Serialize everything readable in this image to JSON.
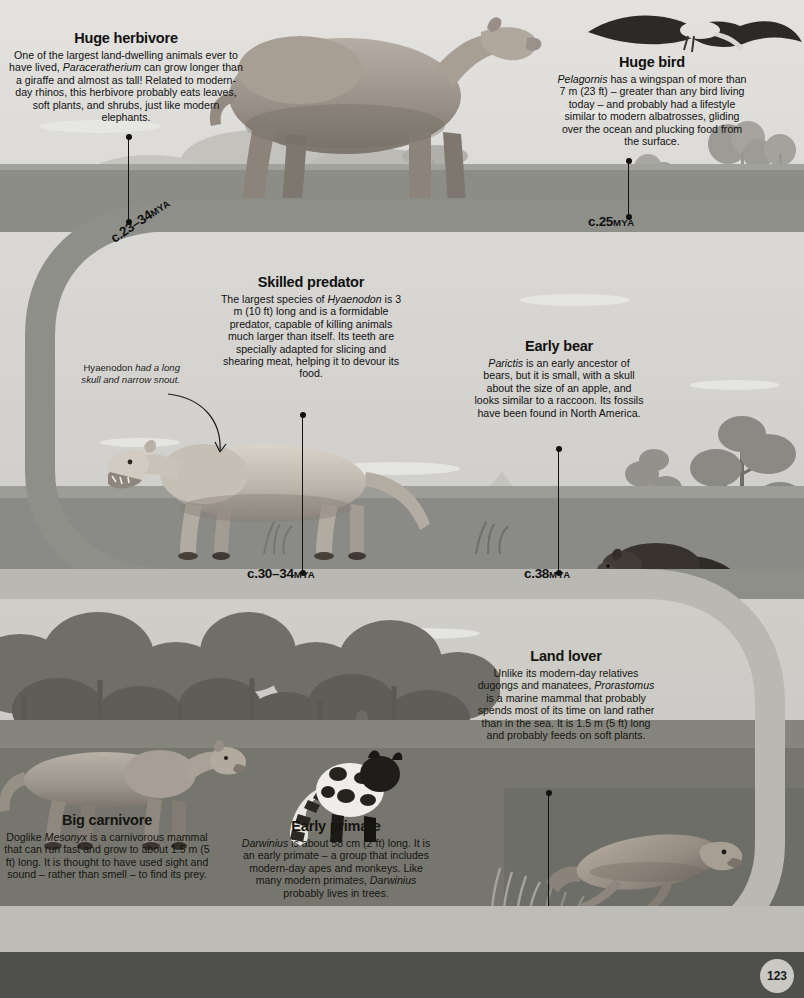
{
  "page": {
    "number": "123"
  },
  "entries": [
    {
      "id": "huge-herbivore",
      "title": "Huge herbivore",
      "body": "One of the largest land-dwelling animals ever to have lived, Paraceratherium can grow longer than a giraffe and almost as tall! Related to modern-day rhinos, this herbivore probably eats leaves, soft plants, and shrubs, just like modern elephants.",
      "genus": "Paraceratherium",
      "date": "c.23–34",
      "date_unit": "MYA"
    },
    {
      "id": "huge-bird",
      "title": "Huge bird",
      "body": "Pelagornis has a wingspan of more than 7 m (23 ft) – greater than any bird living today – and probably had a lifestyle similar to modern albatrosses, gliding over the ocean and plucking food from the surface.",
      "genus": "Pelagornis",
      "date": "c.25",
      "date_unit": "MYA"
    },
    {
      "id": "skilled-predator",
      "title": "Skilled predator",
      "body": "The largest species of Hyaenodon is 3 m (10 ft) long and is a formidable predator, capable of killing animals much larger than itself. Its teeth are specially adapted for slicing and shearing meat, helping it to devour its food.",
      "genus": "Hyaenodon",
      "date": "c.30–34",
      "date_unit": "MYA"
    },
    {
      "id": "early-bear",
      "title": "Early bear",
      "body": "Parictis is an early ancestor of bears, but it is small, with a skull about the size of an apple, and looks similar to a raccoon. Its fossils have been found in North America.",
      "genus": "Parictis",
      "date": "c.38",
      "date_unit": "MYA"
    },
    {
      "id": "big-carnivore",
      "title": "Big carnivore",
      "body": "Doglike Mesonyx is a carnivorous mammal that can run fast and grow to about 1.5 m (5 ft) long. It is thought to have used sight and sound – rather than smell – to find its prey.",
      "genus": "Mesonyx",
      "date": "c.52",
      "date_unit": "MYA"
    },
    {
      "id": "early-primate",
      "title": "Early primate",
      "body": "Darwinius is about 58 cm (2 ft) long. It is an early primate – a group that includes modern-day apes and monkeys. Like many modern primates, Darwinius probably lives in trees.",
      "genus": "Darwinius",
      "date": "c.47",
      "date_unit": "MYA"
    },
    {
      "id": "land-lover",
      "title": "Land lover",
      "body": "Unlike its modern-day relatives dugongs and manatees, Prorastomus is a marine mammal that probably spends most of its time on land rather than in the sea. It is 1.5 m (5 ft) long and probably feeds on soft plants.",
      "genus": "Prorastomus",
      "date": "c.40",
      "date_unit": "MYA"
    }
  ],
  "annotations": [
    {
      "id": "hyaenodon-skull-note",
      "lead": "Hyaenodon",
      "emphasis": "had a long skull and narrow snout."
    }
  ],
  "rich_text": {
    "huge_herbivore_parts": [
      {
        "t": "One of the largest land-dwelling animals ever to have lived, ",
        "i": false
      },
      {
        "t": "Paraceratherium",
        "i": true
      },
      {
        "t": " can grow longer than a giraffe and almost as tall! Related to modern-day rhinos, this herbivore probably eats leaves, soft plants, and shrubs, just like modern elephants.",
        "i": false
      }
    ],
    "huge_bird_parts": [
      {
        "t": "Pelagornis",
        "i": true
      },
      {
        "t": " has a wingspan of more than 7 m (23 ft) – greater than any bird living today – and probably had a lifestyle similar to modern albatrosses, gliding over the ocean and plucking food from the surface.",
        "i": false
      }
    ],
    "skilled_predator_parts": [
      {
        "t": "The largest species of ",
        "i": false
      },
      {
        "t": "Hyaenodon",
        "i": true
      },
      {
        "t": " is 3 m (10 ft) long and is a formidable predator, capable of killing animals much larger than itself. Its teeth are specially adapted for slicing and shearing meat, helping it to devour its food.",
        "i": false
      }
    ],
    "early_bear_parts": [
      {
        "t": "Parictis",
        "i": true
      },
      {
        "t": " is an early ancestor of bears, but it is small, with a skull about the size of an apple, and looks similar to a raccoon. Its fossils have been found in North America.",
        "i": false
      }
    ],
    "big_carnivore_parts": [
      {
        "t": "Doglike ",
        "i": false
      },
      {
        "t": "Mesonyx",
        "i": true
      },
      {
        "t": " is a carnivorous mammal that can run fast and grow to about 1.5 m (5 ft) long. It is thought to have used sight and sound – rather than smell – to find its prey.",
        "i": false
      }
    ],
    "early_primate_parts": [
      {
        "t": "Darwinius",
        "i": true
      },
      {
        "t": " is about 58 cm (2 ft) long. It is an early primate – a group that includes modern-day apes and monkeys. Like many modern primates, ",
        "i": false
      },
      {
        "t": "Darwinius",
        "i": true
      },
      {
        "t": " probably lives in trees.",
        "i": false
      }
    ],
    "land_lover_parts": [
      {
        "t": "Unlike its modern-day relatives dugongs and manatees, ",
        "i": false
      },
      {
        "t": "Prorastomus",
        "i": true
      },
      {
        "t": " is a marine mammal that probably spends most of its time on land rather than in the sea. It is 1.5 m (5 ft) long and probably feeds on soft plants.",
        "i": false
      }
    ],
    "hyaenodon_note_parts": [
      {
        "t": "Hyaenodon ",
        "i": false
      },
      {
        "t": "had a long skull and narrow snout.",
        "i": true
      }
    ]
  },
  "colors": {
    "ribbon_dark": "#8f8f8a",
    "ribbon_light": "#b9b8b3",
    "ink": "#111111",
    "sky_top": "#e3e2df",
    "ground_top": "#8d8d88",
    "ground_mid": "#8a8a86",
    "ground_bottom": "#76766f",
    "footer": "#4f4f4b",
    "date_strip": "#bdbcb7",
    "page_badge": "#c9c8c3"
  }
}
